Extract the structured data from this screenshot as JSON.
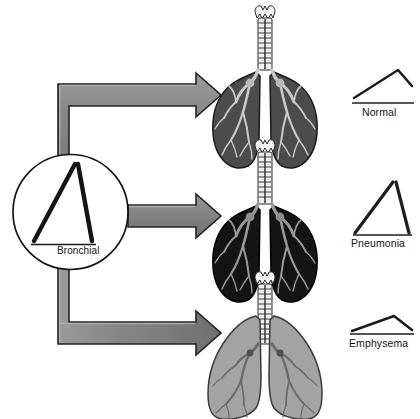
{
  "diagram": {
    "source_node": {
      "label": "Bronchial",
      "icon": "bronchial-waveform-icon"
    },
    "arrows": [
      {
        "name": "arrow-to-normal",
        "shape": "elbow-up-right",
        "color": "#7d7d7d"
      },
      {
        "name": "arrow-to-pneumonia",
        "shape": "straight-right",
        "color": "#7d7d7d"
      },
      {
        "name": "arrow-to-emphysema",
        "shape": "elbow-down-right",
        "color": "#7d7d7d"
      }
    ],
    "rows": [
      {
        "id": "normal",
        "label": "Normal",
        "lung_icon": "lung-normal-icon",
        "lung_fill": "#4c4c4c",
        "lung_tree_fill": "#c9c9c9",
        "waveform_icon": "waveform-normal-icon",
        "waveform_desc": "gradual rise to late peak then short steep fall"
      },
      {
        "id": "pneumonia",
        "label": "Pneumonia",
        "lung_icon": "lung-pneumonia-icon",
        "lung_fill": "#141414",
        "lung_tree_fill": "#9a9a9a",
        "waveform_icon": "waveform-pneumonia-icon",
        "waveform_desc": "tall narrow peak, steep rise and steep fall"
      },
      {
        "id": "emphysema",
        "label": "Emphysema",
        "lung_icon": "lung-emphysema-icon",
        "lung_fill": "#a3a3a3",
        "lung_tree_fill": "#6b6b6b",
        "waveform_icon": "waveform-emphysema-icon",
        "waveform_desc": "low wide flattened hump"
      }
    ],
    "colors": {
      "ink": "#141414",
      "arrow_fill": "#7d7d7d",
      "arrow_highlight": "#9d9d9d",
      "arrow_shadow": "#5a5a5a",
      "background": "#ffffff",
      "trachea_fill": "#f2f2f2"
    }
  }
}
